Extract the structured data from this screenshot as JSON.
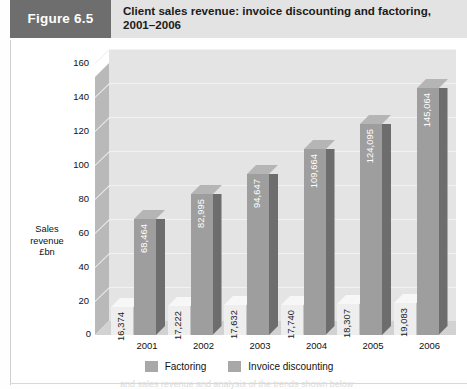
{
  "header": {
    "figure_badge": "Figure 6.5",
    "title": "Client sales revenue: invoice discounting and factoring, 2001–2006"
  },
  "page_bleed_text": "and sales revenue and analysis of the trends shown below",
  "chart_data": {
    "type": "bar",
    "title": "Client sales revenue: invoice discounting and factoring, 2001–2006",
    "xlabel": "",
    "ylabel": "Sales revenue £bn",
    "ylabel_lines": [
      "Sales",
      "revenue",
      "£bn"
    ],
    "categories": [
      "2001",
      "2002",
      "2003",
      "2004",
      "2005",
      "2006"
    ],
    "ylim": [
      0,
      160
    ],
    "ytick_step": 20,
    "yticks": [
      "0",
      "20",
      "40",
      "60",
      "80",
      "100",
      "120",
      "140",
      "160"
    ],
    "grid": true,
    "legend_position": "bottom",
    "threed": true,
    "series": [
      {
        "name": "Factoring",
        "color": "#eeeeee",
        "values": [
          16.374,
          17.222,
          17.632,
          17.74,
          18.307,
          19.083
        ],
        "labels": [
          "16,374",
          "17,222",
          "17,632",
          "17,740",
          "18,307",
          "19,083"
        ]
      },
      {
        "name": "Invoice discounting",
        "color": "#9e9e9e",
        "values": [
          68.464,
          82.995,
          94.647,
          109.664,
          124.095,
          145.064
        ],
        "labels": [
          "68,464",
          "82,995",
          "94,647",
          "109,664",
          "124,095",
          "145,064"
        ]
      }
    ]
  },
  "colors": {
    "badge_bg": "#6e6e6e",
    "title_bg": "#e3e3e3",
    "plot_back_wall": "#e4e4e4",
    "plot_left_wall": "#b9b9b9",
    "plot_floor": "#d2d2d2",
    "factoring": "#eeeeee",
    "invoice_discounting": "#9e9e9e"
  }
}
